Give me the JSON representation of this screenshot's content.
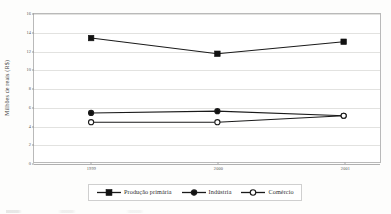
{
  "chart_data": {
    "type": "line",
    "title": "",
    "subtitle": "",
    "xlabel": "",
    "ylabel": "Milhões de reais (R$)",
    "categories": [
      "1999",
      "2000",
      "2001"
    ],
    "series": [
      {
        "name": "Produção primária",
        "marker": "filled-square",
        "values": [
          13.4,
          11.7,
          13.0
        ]
      },
      {
        "name": "Indústria",
        "marker": "filled-circle",
        "values": [
          5.3,
          5.5,
          5.0
        ]
      },
      {
        "name": "Comércio",
        "marker": "open-circle",
        "values": [
          4.3,
          4.3,
          5.0
        ]
      }
    ],
    "ylim": [
      0,
      16
    ],
    "yticks": [
      0,
      2,
      4,
      6,
      8,
      10,
      12,
      14,
      16
    ],
    "ytick_labels": [
      "0",
      "2",
      "4",
      "6",
      "8",
      "10",
      "12",
      "14",
      "16"
    ],
    "xticks": [
      "1999",
      "2000",
      "2001"
    ],
    "grid": "horizontal",
    "legend_position": "bottom",
    "colors": {
      "line": "#1a1a1a",
      "marker_fill": "#111111",
      "marker_open_fill": "#ffffff",
      "gridline": "#e2e2e0",
      "frame": "#b9b9b9",
      "background": "#ffffff"
    }
  },
  "legend": {
    "entries": [
      {
        "label": "Produção primária",
        "marker": "filled-square"
      },
      {
        "label": "Indústria",
        "marker": "filled-circle"
      },
      {
        "label": "Comércio",
        "marker": "open-circle"
      }
    ]
  }
}
